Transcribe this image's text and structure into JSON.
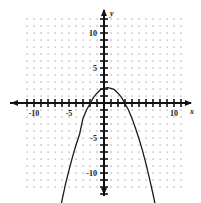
{
  "chart_data": {
    "type": "line",
    "title": "",
    "xlabel": "x",
    "ylabel": "y",
    "xlim": [
      -11.5,
      12.5
    ],
    "ylim": [
      -13.5,
      13.5
    ],
    "grid": true,
    "grid_style": "dotted",
    "legend": "none",
    "x_tick_labels": [
      "-10",
      "-5",
      "10"
    ],
    "x_tick_label_values": [
      -10,
      -5,
      10
    ],
    "y_tick_labels": [
      "10",
      "5",
      "-5",
      "-10"
    ],
    "y_tick_label_values": [
      10,
      5,
      -5,
      -10
    ],
    "tick_interval": 1,
    "curve_name": "parabola",
    "vertex": [
      0.5,
      2.2
    ],
    "roots": [
      -2.5,
      3.5
    ],
    "leading_coefficient": -0.36,
    "series": [
      {
        "name": "parabola",
        "x": [
          -7.3,
          -7.0,
          -6.5,
          -6.0,
          -5.5,
          -5.0,
          -4.5,
          -4.0,
          -3.5,
          -3.0,
          -2.5,
          -2.0,
          -1.5,
          -1.0,
          -0.5,
          0.0,
          0.5,
          1.0,
          1.5,
          2.0,
          2.5,
          3.0,
          3.5,
          4.0,
          4.5,
          5.0,
          5.5,
          6.0,
          6.5,
          7.0,
          7.5,
          8.0,
          8.3
        ],
        "y": [
          -20.6,
          -19.0,
          -16.3,
          -13.9,
          -11.6,
          -9.6,
          -7.7,
          -6.0,
          -4.5,
          -2.2,
          -1.0,
          -0.1,
          0.8,
          1.4,
          1.9,
          2.1,
          2.2,
          2.1,
          1.9,
          1.4,
          0.8,
          -0.1,
          -1.0,
          -2.2,
          -3.6,
          -5.1,
          -6.8,
          -8.7,
          -10.8,
          -13.0,
          -15.4,
          -18.0,
          -19.7
        ]
      }
    ]
  },
  "labels": {
    "y_axis_name": "y",
    "x_axis_name": "x"
  }
}
